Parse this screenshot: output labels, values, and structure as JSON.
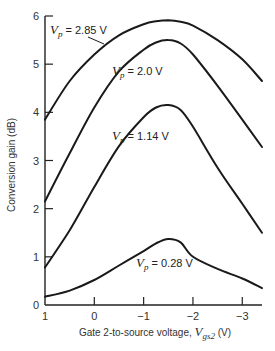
{
  "chart_data": {
    "type": "line",
    "title": "",
    "xlabel": "Gate 2-to-source voltage, V_gs2 (V)",
    "xlabel_parts": {
      "prefix": "Gate 2-to-source voltage, ",
      "var": "V",
      "sub": "gs2",
      "unit": " (V)"
    },
    "ylabel": "Conversion gain (dB)",
    "xlim": [
      1,
      -3.4
    ],
    "ylim": [
      0,
      6
    ],
    "x_reversed": true,
    "grid": false,
    "legend": "inline labels",
    "xticks": [
      1,
      0,
      -1,
      -2,
      -3
    ],
    "xtick_labels": [
      "1",
      "0",
      "−1",
      "−2",
      "−3"
    ],
    "yticks": [
      0,
      1,
      2,
      3,
      4,
      5,
      6
    ],
    "ytick_labels": [
      "0",
      "1",
      "2",
      "3",
      "4",
      "5",
      "6"
    ],
    "x": [
      1.0,
      0.5,
      0.0,
      -0.5,
      -1.0,
      -1.25,
      -1.5,
      -1.75,
      -2.0,
      -2.5,
      -3.0,
      -3.4
    ],
    "series": [
      {
        "name": "Vp = 2.85 V",
        "label_var": "V",
        "label_sub": "p",
        "label_value": " = 2.85 V",
        "values": [
          3.85,
          4.65,
          5.2,
          5.6,
          5.83,
          5.89,
          5.91,
          5.88,
          5.8,
          5.5,
          5.1,
          4.65
        ]
      },
      {
        "name": "Vp = 2.0 V",
        "label_var": "V",
        "label_sub": "p",
        "label_value": " = 2.0 V",
        "values": [
          2.15,
          3.15,
          4.1,
          4.85,
          5.3,
          5.45,
          5.5,
          5.43,
          5.2,
          4.55,
          3.85,
          3.28
        ]
      },
      {
        "name": "Vp = 1.14 V",
        "label_var": "V",
        "label_sub": "p",
        "label_value": " = 1.14 V",
        "values": [
          0.78,
          1.55,
          2.45,
          3.3,
          3.9,
          4.1,
          4.15,
          4.05,
          3.7,
          2.85,
          2.1,
          1.5
        ]
      },
      {
        "name": "Vp = 0.28 V",
        "label_var": "V",
        "label_sub": "p",
        "label_value": " = 0.28 V",
        "values": [
          0.17,
          0.3,
          0.52,
          0.82,
          1.12,
          1.28,
          1.37,
          1.3,
          1.0,
          0.75,
          0.55,
          0.35
        ]
      }
    ]
  }
}
